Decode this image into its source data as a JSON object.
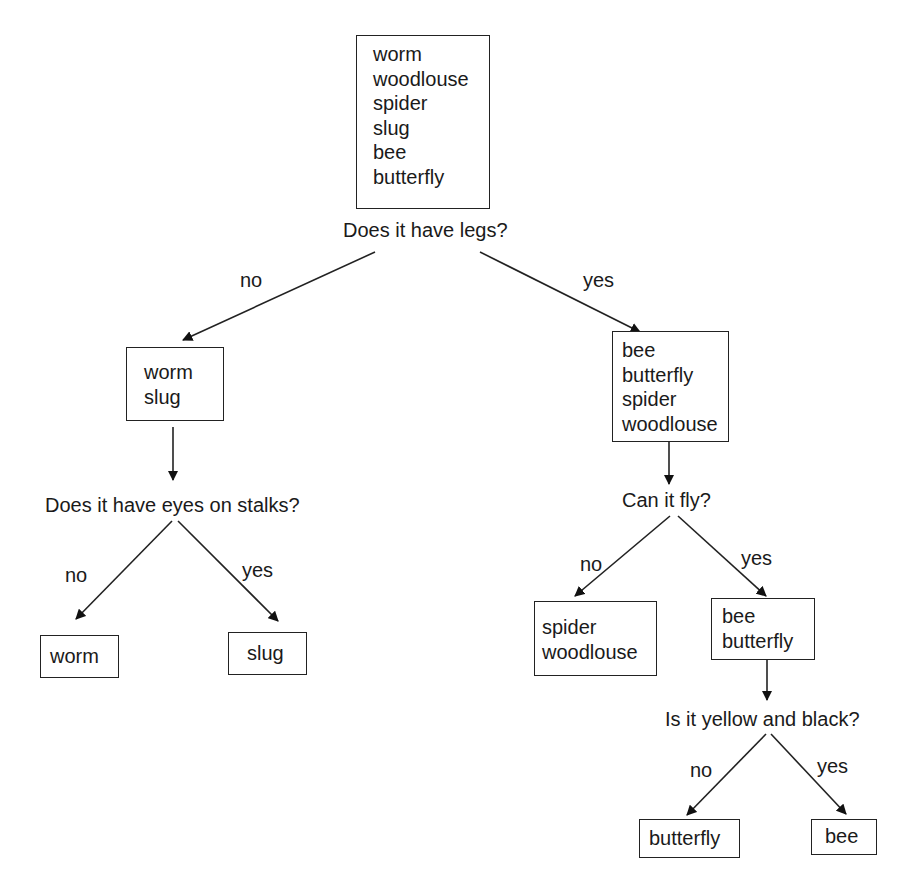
{
  "diagram": {
    "type": "dichotomous-key",
    "nodes": {
      "root": {
        "items": [
          "worm",
          "woodlouse",
          "spider",
          "slug",
          "bee",
          "butterfly"
        ]
      },
      "q_legs": "Does it have legs?",
      "legs_no": {
        "items": [
          "worm",
          "slug"
        ]
      },
      "legs_yes": {
        "items": [
          "bee",
          "butterfly",
          "spider",
          "woodlouse"
        ]
      },
      "q_eyes": "Does it have eyes on stalks?",
      "eyes_no": {
        "items": [
          "worm"
        ]
      },
      "eyes_yes": {
        "items": [
          "slug"
        ]
      },
      "q_fly": "Can it fly?",
      "fly_no": {
        "items": [
          "spider",
          "woodlouse"
        ]
      },
      "fly_yes": {
        "items": [
          "bee",
          "butterfly"
        ]
      },
      "q_yellow": "Is it yellow and black?",
      "yellow_no": {
        "items": [
          "butterfly"
        ]
      },
      "yellow_yes": {
        "items": [
          "bee"
        ]
      }
    },
    "branch_labels": {
      "legs_no": "no",
      "legs_yes": "yes",
      "eyes_no": "no",
      "eyes_yes": "yes",
      "fly_no": "no",
      "fly_yes": "yes",
      "yellow_no": "no",
      "yellow_yes": "yes"
    },
    "colors": {
      "line": "#222222",
      "text": "#1a1a1a",
      "background": "#ffffff"
    }
  }
}
